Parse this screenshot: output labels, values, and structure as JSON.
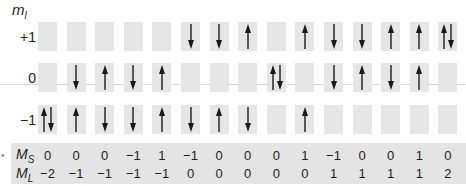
{
  "axis": {
    "title": "m",
    "title_sub": "l"
  },
  "rows": [
    {
      "label": "+1",
      "key": "p1"
    },
    {
      "label": "0",
      "key": "z"
    },
    {
      "label": "−1",
      "key": "m1"
    }
  ],
  "columns": [
    {
      "p1": "",
      "z": "",
      "m1": "UD",
      "MS": "0",
      "ML": "−2"
    },
    {
      "p1": "",
      "z": "D",
      "m1": "U",
      "MS": "0",
      "ML": "−1"
    },
    {
      "p1": "",
      "z": "U",
      "m1": "D",
      "MS": "0",
      "ML": "−1"
    },
    {
      "p1": "",
      "z": "D",
      "m1": "D",
      "MS": "−1",
      "ML": "−1"
    },
    {
      "p1": "",
      "z": "U",
      "m1": "U",
      "MS": "1",
      "ML": "−1"
    },
    {
      "p1": "D",
      "z": "",
      "m1": "D",
      "MS": "−1",
      "ML": "0"
    },
    {
      "p1": "D",
      "z": "",
      "m1": "U",
      "MS": "0",
      "ML": "0"
    },
    {
      "p1": "U",
      "z": "",
      "m1": "D",
      "MS": "0",
      "ML": "0"
    },
    {
      "p1": "",
      "z": "UD",
      "m1": "",
      "MS": "0",
      "ML": "0"
    },
    {
      "p1": "U",
      "z": "",
      "m1": "U",
      "MS": "1",
      "ML": "0"
    },
    {
      "p1": "D",
      "z": "D",
      "m1": "",
      "MS": "−1",
      "ML": "1"
    },
    {
      "p1": "D",
      "z": "U",
      "m1": "",
      "MS": "0",
      "ML": "1"
    },
    {
      "p1": "U",
      "z": "D",
      "m1": "",
      "MS": "0",
      "ML": "1"
    },
    {
      "p1": "U",
      "z": "U",
      "m1": "",
      "MS": "1",
      "ML": "1"
    },
    {
      "p1": "UD",
      "z": "",
      "m1": "",
      "MS": "0",
      "ML": "2"
    }
  ],
  "table": {
    "ms_label": "M",
    "ms_sub": "S",
    "ml_label": "M",
    "ml_sub": "L"
  },
  "colors": {
    "box": "#e6e6e6",
    "band": "#e4e4e4",
    "arrow": "#1a1a1a"
  }
}
